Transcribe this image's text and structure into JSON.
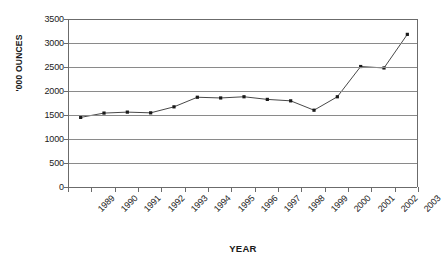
{
  "chart_data": {
    "type": "line",
    "title": "",
    "xlabel": "YEAR",
    "ylabel": "'000 OUNCES",
    "categories": [
      "1989",
      "1990",
      "1991",
      "1992",
      "1993",
      "1994",
      "1995",
      "1996",
      "1997",
      "1998",
      "1999",
      "2000",
      "2001",
      "2002",
      "2003"
    ],
    "values": [
      1450,
      1540,
      1560,
      1545,
      1670,
      1870,
      1855,
      1880,
      1825,
      1795,
      1600,
      1880,
      2510,
      2480,
      3180
    ],
    "ylim": [
      0,
      3500
    ],
    "yticks": [
      3500,
      3000,
      2500,
      2000,
      1500,
      1000,
      500,
      0
    ],
    "ytick_labels": [
      "3500",
      "3000",
      "2500",
      "2000",
      "1500",
      "1000",
      "500",
      "0"
    ],
    "grid": true,
    "grid_axis": "y",
    "legend": false,
    "marker": "square",
    "line_color": "#333333",
    "marker_color": "#1a1a1a",
    "grid_color": "#8a8a8a",
    "axis_color": "#6b6b6b",
    "background": "#ffffff"
  }
}
